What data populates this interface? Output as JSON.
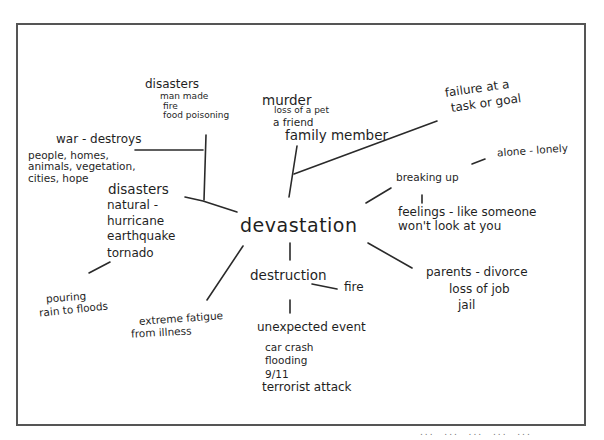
{
  "diagram": {
    "type": "mind-map",
    "style": "handwritten",
    "center": "devastation",
    "nodes": {
      "disasters_man_made": {
        "title": "disasters",
        "lines": [
          "man made",
          "fire",
          "food poisoning"
        ]
      },
      "murder": {
        "title": "murder",
        "lines": [
          "loss of a pet",
          "a friend",
          "family member"
        ]
      },
      "failure": {
        "lines": [
          "failure at a",
          "task or goal"
        ]
      },
      "war": {
        "title": "war - destroys",
        "lines": [
          "people, homes,",
          "animals, vegetation,",
          "cities, hope"
        ]
      },
      "breaking_up": {
        "title": "breaking up",
        "sub": "alone - lonely",
        "lines": [
          "feelings - like someone",
          "won't look at you"
        ]
      },
      "disasters_natural": {
        "title": "disasters",
        "lines": [
          "natural -",
          "hurricane",
          "earthquake",
          "tornado"
        ]
      },
      "pouring_rain": {
        "lines": [
          "pouring",
          "rain to floods"
        ]
      },
      "parents": {
        "lines": [
          "parents - divorce",
          "loss of job",
          "jail"
        ]
      },
      "destruction": {
        "title": "destruction",
        "sub": "fire"
      },
      "fatigue": {
        "lines": [
          "extreme fatigue",
          "from illness"
        ]
      },
      "unexpected": {
        "title": "unexpected event",
        "lines": [
          "car crash",
          "flooding",
          "9/11",
          "terrorist attack"
        ]
      }
    },
    "footer_partial_text": "...  ...  ...  ...  ..."
  }
}
